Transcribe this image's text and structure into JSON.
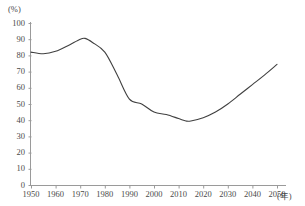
{
  "chart_data": {
    "type": "line",
    "title": "",
    "xlabel": "(年)",
    "ylabel": "(%)",
    "xlim": [
      1950,
      2050
    ],
    "ylim": [
      0,
      100
    ],
    "grid": false,
    "legend": null,
    "line_color": "#404040",
    "x_ticks": [
      1950,
      1960,
      1970,
      1980,
      1990,
      2000,
      2010,
      2020,
      2030,
      2040,
      2050
    ],
    "y_ticks": [
      0,
      10,
      20,
      30,
      40,
      50,
      60,
      70,
      80,
      90,
      100
    ],
    "x": [
      1950,
      1955,
      1960,
      1965,
      1970,
      1972,
      1975,
      1980,
      1985,
      1990,
      1995,
      2000,
      2005,
      2010,
      2013,
      2015,
      2020,
      2025,
      2030,
      2035,
      2040,
      2045,
      2050
    ],
    "values": [
      82,
      81,
      82.5,
      86,
      90,
      90.5,
      88,
      82,
      68,
      53,
      50,
      45,
      43.5,
      41,
      39.5,
      39.5,
      41.5,
      45,
      50,
      56,
      62,
      68,
      74.5
    ],
    "series": [
      {
        "name": "",
        "values": [
          82,
          81,
          82.5,
          86,
          90,
          90.5,
          88,
          82,
          68,
          53,
          50,
          45,
          43.5,
          41,
          39.5,
          39.5,
          41.5,
          45,
          50,
          56,
          62,
          68,
          74.5
        ]
      }
    ]
  },
  "axis": {
    "y_unit": "(%)",
    "x_unit": "(年)"
  }
}
